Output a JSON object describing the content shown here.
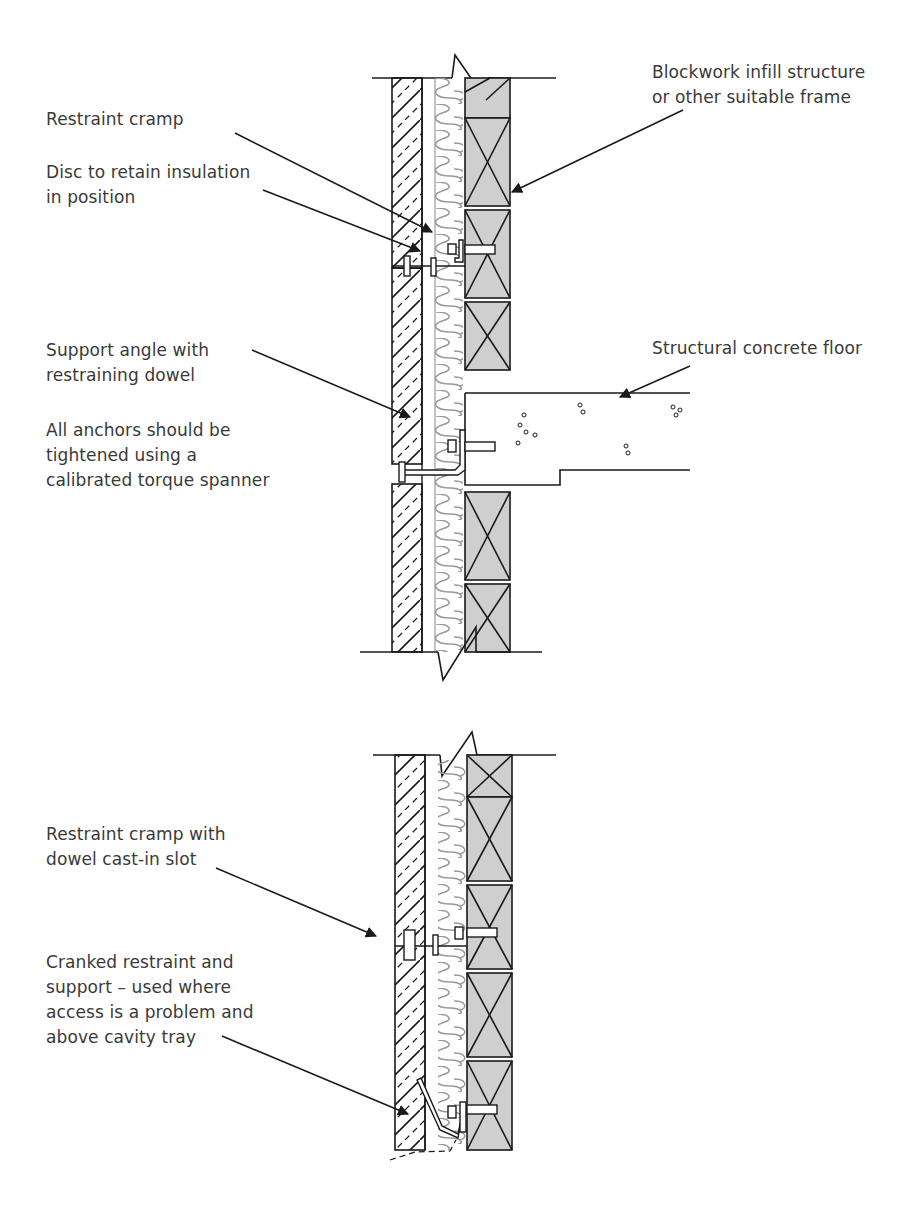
{
  "diagram": {
    "upper_section": {
      "labels": {
        "restraint_cramp": "Restraint cramp",
        "disc_retain": "Disc to retain insulation\nin position",
        "support_angle": "Support angle with\nrestraining dowel",
        "anchors_note": "All anchors should be\ntightened using a\ncalibrated torque spanner",
        "blockwork": "Blockwork infill structure\nor other suitable frame",
        "concrete_floor": "Structural concrete floor"
      }
    },
    "lower_section": {
      "labels": {
        "restraint_dowel": "Restraint cramp with\ndowel cast-in slot",
        "cranked": "Cranked restraint and\nsupport  – used where\naccess is a problem and\nabove cavity tray"
      }
    },
    "colors": {
      "line": "#1a1a1a",
      "block_fill": "#cfcfcf",
      "insulation_line": "#9a9a9a",
      "text": "#3a3a3a"
    }
  }
}
